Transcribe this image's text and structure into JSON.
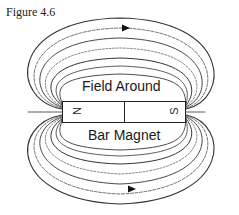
{
  "figure": {
    "label": "Figure 4.6",
    "title_line1": "Field Around",
    "title_line2": "Bar Magnet"
  },
  "magnet": {
    "north_label": "N",
    "south_label": "S"
  },
  "colors": {
    "ink": "#222222",
    "background": "#ffffff"
  }
}
